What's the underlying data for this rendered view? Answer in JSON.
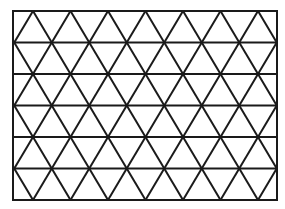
{
  "diagram": {
    "type": "triangular-grid",
    "rows": 6,
    "frame": {
      "x": 13,
      "y": 11,
      "width": 264,
      "height": 189
    },
    "row_height": 31.5,
    "triangle_side": 37.5,
    "even_line_offset_x": 33,
    "odd_line_offset_x": 14.25,
    "stroke_color": "#1a1a1a",
    "stroke_width": 2,
    "background": "#ffffff"
  }
}
